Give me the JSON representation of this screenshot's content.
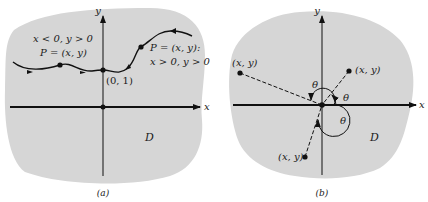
{
  "colors": {
    "region": "#d6d6d6",
    "ink": "#111111",
    "background": "#ffffff"
  },
  "panel_a": {
    "caption": "(a)",
    "x_axis": "x",
    "y_axis": "y",
    "region_label": "D",
    "left_text_1": "x < 0, y > 0",
    "left_text_2": "P = (x, y)",
    "right_text_1": "P = (x, y):",
    "right_text_2": "x > 0, y > 0",
    "point_label": "(0, 1)"
  },
  "panel_b": {
    "caption": "(b)",
    "x_axis": "x",
    "y_axis": "y",
    "region_label": "D",
    "point_upper_left": "(x, y)",
    "point_upper_right": "(x, y)",
    "point_lower_left": "(x, y)",
    "theta_1": "θ",
    "theta_2": "θ",
    "theta_3": "θ"
  }
}
